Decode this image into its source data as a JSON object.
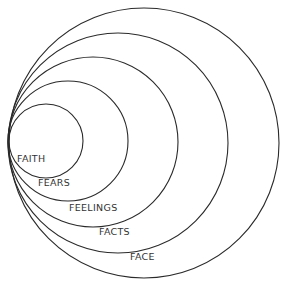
{
  "diagram": {
    "type": "nested-circles",
    "stroke_color": "#2a2a2a",
    "text_color": "#333333",
    "layers": [
      {
        "label": "FAITH",
        "cx": 46,
        "cy": 141,
        "r": 37,
        "label_x": 17,
        "label_y": 162
      },
      {
        "label": "FEARS",
        "cx": 68,
        "cy": 141,
        "r": 60,
        "label_x": 38,
        "label_y": 186
      },
      {
        "label": "FEELINGS",
        "cx": 93,
        "cy": 142,
        "r": 85,
        "label_x": 69,
        "label_y": 211
      },
      {
        "label": "FACTS",
        "cx": 118,
        "cy": 143,
        "r": 110,
        "label_x": 99,
        "label_y": 235
      },
      {
        "label": "FACE",
        "cx": 144,
        "cy": 143,
        "r": 135,
        "label_x": 130,
        "label_y": 260
      }
    ]
  }
}
